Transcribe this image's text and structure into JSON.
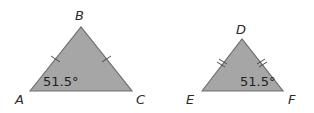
{
  "colors": {
    "fill": "#a6a6a6",
    "stroke": "#6e6e6e",
    "text": "#222222"
  },
  "triangles": [
    {
      "id": "ABC",
      "vertices": {
        "A": {
          "label": "A"
        },
        "B": {
          "label": "B"
        },
        "C": {
          "label": "C"
        }
      },
      "angle_label": "51.5°",
      "angle_at": "A",
      "tick_marks": "single",
      "congruent_sides": [
        "AB",
        "BC"
      ]
    },
    {
      "id": "DEF",
      "vertices": {
        "D": {
          "label": "D"
        },
        "E": {
          "label": "E"
        },
        "F": {
          "label": "F"
        }
      },
      "angle_label": "51.5°",
      "angle_at": "F",
      "tick_marks": "double",
      "congruent_sides": [
        "DE",
        "DF"
      ]
    }
  ]
}
